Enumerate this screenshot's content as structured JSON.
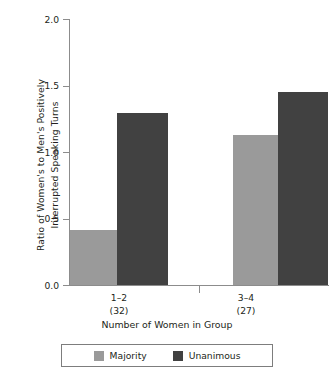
{
  "chart_data": {
    "type": "bar",
    "title": "",
    "xlabel": "Number of Women in Group",
    "ylabel": "Ratio of Women's to Men's Positively Interrupted Speaking Turns",
    "ylabel_lines": [
      "Ratio of Women's to Men's Positively",
      "Interrupted Speaking Turns"
    ],
    "categories": [
      "1–2",
      "3–4"
    ],
    "category_counts": [
      "(32)",
      "(27)"
    ],
    "ylim": [
      0.0,
      2.0
    ],
    "yticks": [
      0.0,
      0.5,
      1.0,
      1.5,
      2.0
    ],
    "ytick_labels": [
      "0.0",
      "0.5",
      "1.0",
      "1.5",
      "2.0"
    ],
    "grid": false,
    "legend_position": "bottom",
    "series": [
      {
        "name": "Majority",
        "color": "#9a9a9a",
        "values": [
          0.41,
          1.13
        ]
      },
      {
        "name": "Unanimous",
        "color": "#414141",
        "values": [
          1.29,
          1.45
        ]
      }
    ]
  },
  "axes": {
    "y_title_line1": "Ratio of Women's to Men's Positively",
    "y_title_line2": "Interrupted Speaking Turns",
    "x_title": "Number of Women in Group",
    "ytick_0": "0.0",
    "ytick_1": "0.5",
    "ytick_2": "1.0",
    "ytick_3": "1.5",
    "ytick_4": "2.0"
  },
  "xlabels": {
    "group0_category": "1–2",
    "group0_count": "(32)",
    "group1_category": "3–4",
    "group1_count": "(27)"
  },
  "legend": {
    "majority_label": "Majority",
    "unanimous_label": "Unanimous"
  }
}
